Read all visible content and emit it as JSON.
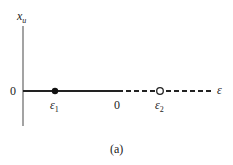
{
  "figure": {
    "caption": "(a)",
    "y_axis_label": "x",
    "y_axis_label_sub": "u",
    "x_axis_label": "ε",
    "origin_label": "0",
    "x_zero_label": "0",
    "points": [
      {
        "name": "ε",
        "sub": "1",
        "type": "filled",
        "note": "stable"
      },
      {
        "name": "ε",
        "sub": "2",
        "type": "open",
        "note": "unstable"
      }
    ],
    "segments": [
      {
        "style": "solid",
        "from": "-∞",
        "to": "0"
      },
      {
        "style": "dashed",
        "from": "0",
        "to": "+∞"
      }
    ],
    "colors": {
      "line": "#222222",
      "background": "#ffffff"
    }
  }
}
